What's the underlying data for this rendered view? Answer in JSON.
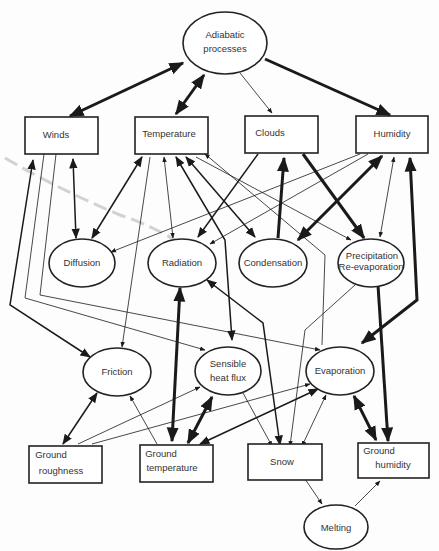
{
  "diagram": {
    "type": "causal-network",
    "nodes": {
      "adiabatic": {
        "line1": "Adiabatic",
        "line2": "processes",
        "shape": "ellipse"
      },
      "winds": {
        "label": "Winds",
        "shape": "box"
      },
      "temperature": {
        "label": "Temperature",
        "shape": "box"
      },
      "clouds": {
        "label": "Clouds",
        "shape": "box"
      },
      "humidity": {
        "label": "Humidity",
        "shape": "box"
      },
      "diffusion": {
        "label": "Diffusion",
        "shape": "ellipse"
      },
      "radiation": {
        "label": "Radiation",
        "shape": "ellipse"
      },
      "condensation": {
        "label": "Condensation",
        "shape": "ellipse"
      },
      "precipitation": {
        "line1": "Precipitation",
        "line2": "Re-evaporation",
        "shape": "ellipse"
      },
      "friction": {
        "label": "Friction",
        "shape": "ellipse"
      },
      "sensible": {
        "line1": "Sensible",
        "line2": "heat flux",
        "shape": "ellipse"
      },
      "evaporation": {
        "label": "Evaporation",
        "shape": "ellipse"
      },
      "ground_roughness": {
        "line1": "Ground",
        "line2": "roughness",
        "shape": "box"
      },
      "ground_temperature": {
        "line1": "Ground",
        "line2": "temperature",
        "shape": "box"
      },
      "snow": {
        "label": "Snow",
        "shape": "box"
      },
      "ground_humidity": {
        "line1": "Ground",
        "line2": "humidity",
        "shape": "box"
      },
      "melting": {
        "label": "Melting",
        "shape": "ellipse"
      }
    },
    "edges": [
      {
        "from": "Adiabatic processes",
        "to": "Winds",
        "weight": "heavy",
        "direction": "both"
      },
      {
        "from": "Adiabatic processes",
        "to": "Temperature",
        "weight": "heavy",
        "direction": "both"
      },
      {
        "from": "Adiabatic processes",
        "to": "Clouds",
        "weight": "light",
        "direction": "forward"
      },
      {
        "from": "Adiabatic processes",
        "to": "Humidity",
        "weight": "heavy",
        "direction": "forward"
      },
      {
        "from": "Winds",
        "to": "Diffusion",
        "weight": "medium",
        "direction": "both"
      },
      {
        "from": "Winds",
        "to": "Friction",
        "weight": "medium",
        "direction": "both"
      },
      {
        "from": "Winds",
        "to": "Sensible heat flux",
        "weight": "light",
        "direction": "forward"
      },
      {
        "from": "Winds",
        "to": "Evaporation",
        "weight": "light",
        "direction": "forward"
      },
      {
        "from": "Temperature",
        "to": "Diffusion",
        "weight": "medium",
        "direction": "both"
      },
      {
        "from": "Temperature",
        "to": "Friction",
        "weight": "light",
        "direction": "forward"
      },
      {
        "from": "Temperature",
        "to": "Radiation",
        "weight": "light",
        "direction": "both"
      },
      {
        "from": "Temperature",
        "to": "Sensible heat flux",
        "weight": "medium",
        "direction": "both"
      },
      {
        "from": "Temperature",
        "to": "Condensation",
        "weight": "medium",
        "direction": "both"
      },
      {
        "from": "Temperature",
        "to": "Precipitation Re-evaporation",
        "weight": "light",
        "direction": "forward"
      },
      {
        "from": "Evaporation",
        "to": "Temperature",
        "weight": "light",
        "direction": "forward"
      },
      {
        "from": "Clouds",
        "to": "Radiation",
        "weight": "medium",
        "direction": "forward"
      },
      {
        "from": "Condensation",
        "to": "Clouds",
        "weight": "heavy",
        "direction": "forward"
      },
      {
        "from": "Clouds",
        "to": "Precipitation Re-evaporation",
        "weight": "heavy",
        "direction": "forward"
      },
      {
        "from": "Humidity",
        "to": "Diffusion",
        "weight": "light",
        "direction": "forward"
      },
      {
        "from": "Humidity",
        "to": "Radiation",
        "weight": "light",
        "direction": "forward"
      },
      {
        "from": "Humidity",
        "to": "Condensation",
        "weight": "heavy",
        "direction": "both"
      },
      {
        "from": "Humidity",
        "to": "Precipitation Re-evaporation",
        "weight": "light",
        "direction": "both"
      },
      {
        "from": "Humidity",
        "to": "Evaporation",
        "weight": "heavy",
        "direction": "both"
      },
      {
        "from": "Radiation",
        "to": "Ground temperature",
        "weight": "heavy",
        "direction": "both"
      },
      {
        "from": "Radiation",
        "to": "Snow",
        "weight": "medium",
        "direction": "both"
      },
      {
        "from": "Precipitation Re-evaporation",
        "to": "Ground humidity",
        "weight": "heavy",
        "direction": "forward"
      },
      {
        "from": "Precipitation Re-evaporation",
        "to": "Snow",
        "weight": "light",
        "direction": "forward"
      },
      {
        "from": "Friction",
        "to": "Ground roughness",
        "weight": "medium",
        "direction": "both"
      },
      {
        "from": "Ground temperature",
        "to": "Friction",
        "weight": "light",
        "direction": "forward"
      },
      {
        "from": "Ground temperature",
        "to": "Sensible heat flux",
        "weight": "heavy",
        "direction": "both"
      },
      {
        "from": "Ground temperature",
        "to": "Evaporation",
        "weight": "medium",
        "direction": "both"
      },
      {
        "from": "Ground roughness",
        "to": "Sensible heat flux",
        "weight": "light",
        "direction": "forward"
      },
      {
        "from": "Ground roughness",
        "to": "Evaporation",
        "weight": "light",
        "direction": "forward"
      },
      {
        "from": "Sensible heat flux",
        "to": "Snow",
        "weight": "light",
        "direction": "forward"
      },
      {
        "from": "Evaporation",
        "to": "Snow",
        "weight": "light",
        "direction": "both"
      },
      {
        "from": "Evaporation",
        "to": "Ground humidity",
        "weight": "heavy",
        "direction": "both"
      },
      {
        "from": "Snow",
        "to": "Melting",
        "weight": "light",
        "direction": "forward"
      },
      {
        "from": "Melting",
        "to": "Ground humidity",
        "weight": "light",
        "direction": "forward"
      }
    ]
  }
}
